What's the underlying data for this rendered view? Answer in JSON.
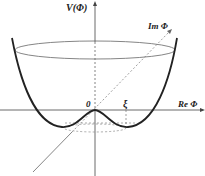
{
  "diagram": {
    "labels": {
      "y_axis": "V(Φ)",
      "re_axis": "Re Φ",
      "im_axis": "Im Φ",
      "origin": "0",
      "minimum": "ξ"
    },
    "colors": {
      "curve": "#222222",
      "axis": "#444444",
      "dashed": "#777777",
      "background": "#ffffff"
    }
  }
}
